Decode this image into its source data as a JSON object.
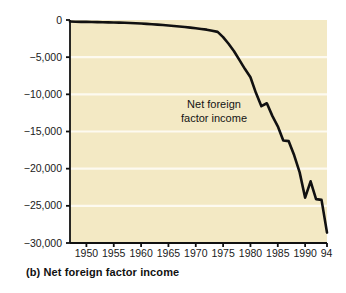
{
  "figure": {
    "caption": "(b) Net foreign factor income",
    "panel_letter": "(b)",
    "background_color": "#ffffff",
    "plot_background_color": "#f3e9c4",
    "gridline_color": "#fdfaf0",
    "line_color": "#111111",
    "axis_color": "#111111"
  },
  "annotation": {
    "line1": "Net foreign",
    "line2": "factor income"
  },
  "axis": {
    "y_ticks": [
      "0",
      "−5,000",
      "−10,000",
      "−15,000",
      "−20,000",
      "−25,000",
      "−30,000"
    ],
    "x_ticks": [
      "1950",
      "1955",
      "1960",
      "1965",
      "1970",
      "1975",
      "1980",
      "1985",
      "1990",
      "94"
    ]
  },
  "chart_data": {
    "type": "line",
    "title": "(b) Net foreign factor income",
    "xlabel": "",
    "ylabel": "",
    "xlim": [
      1947,
      1994
    ],
    "ylim": [
      -30000,
      0
    ],
    "grid": true,
    "legend": "none",
    "annotations": [
      {
        "text": "Net foreign factor income",
        "x": 1977,
        "y": -12300
      }
    ],
    "y_tick_values": [
      0,
      -5000,
      -10000,
      -15000,
      -20000,
      -25000,
      -30000
    ],
    "y_tick_labels": [
      "0",
      "−5,000",
      "−10,000",
      "−15,000",
      "−20,000",
      "−25,000",
      "−30,000"
    ],
    "x_tick_values": [
      1950,
      1955,
      1960,
      1965,
      1970,
      1975,
      1980,
      1985,
      1990,
      1994
    ],
    "x_tick_labels": [
      "1950",
      "1955",
      "1960",
      "1965",
      "1970",
      "1975",
      "1980",
      "1985",
      "1990",
      "94"
    ],
    "series": [
      {
        "name": "Net foreign factor income",
        "color": "#111111",
        "x": [
          1947,
          1948,
          1949,
          1950,
          1951,
          1952,
          1953,
          1954,
          1955,
          1956,
          1957,
          1958,
          1959,
          1960,
          1961,
          1962,
          1963,
          1964,
          1965,
          1966,
          1967,
          1968,
          1969,
          1970,
          1971,
          1972,
          1973,
          1974,
          1975,
          1976,
          1977,
          1978,
          1979,
          1980,
          1981,
          1982,
          1983,
          1984,
          1985,
          1986,
          1987,
          1988,
          1989,
          1990,
          1991,
          1992,
          1993,
          1994
        ],
        "values": [
          -200,
          -230,
          -250,
          -250,
          -260,
          -280,
          -300,
          -320,
          -330,
          -350,
          -380,
          -400,
          -430,
          -470,
          -520,
          -570,
          -620,
          -680,
          -740,
          -800,
          -870,
          -950,
          -1030,
          -1120,
          -1200,
          -1300,
          -1450,
          -1600,
          -2300,
          -3200,
          -4200,
          -5400,
          -6600,
          -7700,
          -9800,
          -11600,
          -11200,
          -12900,
          -14300,
          -16200,
          -16300,
          -18200,
          -20500,
          -23900,
          -21700,
          -24100,
          -24200,
          -28600
        ]
      }
    ]
  }
}
